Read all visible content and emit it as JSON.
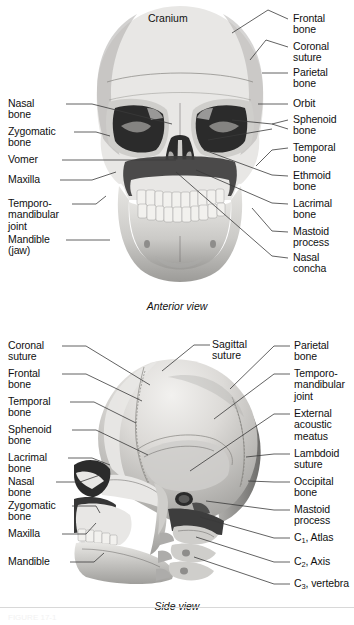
{
  "figure": {
    "title_hidden": "FIGURE 17-1",
    "panels": [
      {
        "id": "anterior",
        "caption": "Anterior view",
        "interior_label": "Cranium",
        "labels_left": [
          "Nasal\nbone",
          "Zygomatic\nbone",
          "Vomer",
          "Maxilla",
          "Temporo-\nmandibular\njoint",
          "Mandible\n(jaw)"
        ],
        "labels_right": [
          "Frontal\nbone",
          "Coronal\nsuture",
          "Parietal\nbone",
          "Orbit",
          "Sphenoid\nbone",
          "Temporal\nbone",
          "Ethmoid\nbone",
          "Lacrimal\nbone",
          "Mastoid\nprocess",
          "Nasal\nconcha"
        ]
      },
      {
        "id": "side",
        "caption": "Side view",
        "interior_label": "Sagittal\nsuture",
        "labels_left": [
          "Coronal\nsuture",
          "Frontal\nbone",
          "Temporal\nbone",
          "Sphenoid\nbone",
          "Lacrimal\nbone",
          "Nasal\nbone",
          "Zygomatic\nbone",
          "Maxilla",
          "Mandible"
        ],
        "labels_right": [
          "Parietal\nbone",
          "Temporo-\nmandibular\njoint",
          "External\nacoustic\nmeatus",
          "Lambdoid\nsuture",
          "Occipital\nbone",
          "Mastoid\nprocess",
          "C1, Atlas",
          "C2, Axis",
          "C3, vertebra"
        ],
        "labels_right_sub": [
          {
            "base": "C",
            "sub": "1",
            "rest": ", Atlas"
          },
          {
            "base": "C",
            "sub": "2",
            "rest": ", Axis"
          },
          {
            "base": "C",
            "sub": "3",
            "rest": ", vertebra"
          }
        ]
      }
    ],
    "colors": {
      "background": "#ffffff",
      "text": "#101010",
      "leader_line": "#3a3a3a",
      "bone_light": "#e8e7e5",
      "bone_mid": "#cfcecb",
      "bone_dark": "#adacaa",
      "cavity": "#2b2b2b"
    }
  }
}
